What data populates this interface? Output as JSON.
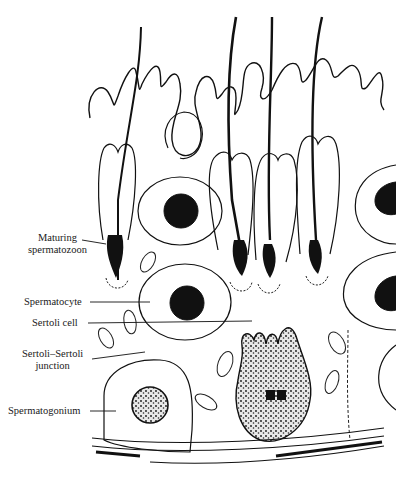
{
  "figure": {
    "labels": [
      {
        "id": "maturing-spermatozoon",
        "line1": "Maturing",
        "line2": "spermatozoon"
      },
      {
        "id": "spermatocyte",
        "line1": "Spermatocyte"
      },
      {
        "id": "sertoli-cell",
        "line1": "Sertoli cell"
      },
      {
        "id": "sertoli-sertoli-junction",
        "line1": "Sertoli–Sertoli",
        "line2": "junction"
      },
      {
        "id": "spermatogonium",
        "line1": "Spermatogonium"
      }
    ],
    "colors": {
      "ink": "#111111",
      "paper": "#ffffff",
      "stipple": "#6a6a6a"
    }
  }
}
